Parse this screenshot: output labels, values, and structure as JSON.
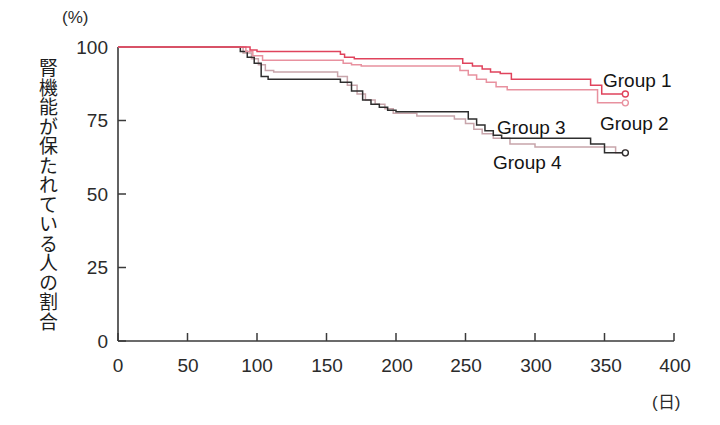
{
  "chart_data": {
    "type": "line",
    "title": "",
    "subtitle": "",
    "xlabel": "(日)",
    "ylabel": "腎機能が保たれている人の割合",
    "y_unit": "(%)",
    "x_unit": "(日)",
    "xlim": [
      0,
      400
    ],
    "ylim": [
      0,
      100
    ],
    "xticks": [
      0,
      50,
      100,
      150,
      200,
      250,
      300,
      350,
      400
    ],
    "xtick_labels": [
      "0",
      "50",
      "100",
      "150",
      "200",
      "250",
      "300",
      "350",
      "400"
    ],
    "yticks": [
      0,
      25,
      50,
      75,
      100
    ],
    "ytick_labels": [
      "0",
      "25",
      "50",
      "75",
      "100"
    ],
    "grid": false,
    "legend_position": "inline-right",
    "step_type": "post",
    "marker": "open-circle-endpoint",
    "series": [
      {
        "name": "Group 1",
        "color": "#e0435c",
        "label_x": 400,
        "label_y": 89,
        "end_value": 84,
        "x": [
          0,
          82,
          95,
          100,
          155,
          160,
          163,
          170,
          240,
          248,
          255,
          262,
          268,
          275,
          283,
          330,
          340,
          348,
          365
        ],
        "y": [
          100,
          100,
          99,
          98.5,
          98.5,
          97.5,
          96.5,
          96,
          96,
          94.5,
          93.5,
          92.5,
          91.5,
          91,
          89,
          89,
          87,
          84,
          84
        ]
      },
      {
        "name": "Group 2",
        "color": "#e8919f",
        "label_x": 400,
        "label_y": 77,
        "end_value": 81,
        "x": [
          0,
          85,
          92,
          97,
          104,
          158,
          162,
          168,
          175,
          238,
          246,
          252,
          258,
          265,
          272,
          280,
          300,
          335,
          345,
          365
        ],
        "y": [
          100,
          100,
          98.5,
          97,
          95.5,
          95.5,
          94.5,
          94,
          93.5,
          93.5,
          92,
          90.5,
          89,
          88,
          86.5,
          85.5,
          85.5,
          85.5,
          81,
          81
        ]
      },
      {
        "name": "Group 3",
        "color": "#2e2e2e",
        "label_x": 268,
        "label_y": 78,
        "end_value": 64,
        "x": [
          0,
          80,
          88,
          93,
          98,
          103,
          108,
          150,
          160,
          168,
          176,
          182,
          188,
          194,
          200,
          210,
          246,
          252,
          258,
          264,
          270,
          276,
          300,
          330,
          340,
          350,
          365
        ],
        "y": [
          100,
          100,
          98.5,
          96.5,
          94.5,
          90,
          89,
          89,
          88,
          85,
          82,
          80.5,
          79.5,
          78.5,
          78,
          78,
          78,
          75.5,
          73.5,
          71.5,
          70,
          69,
          69,
          69,
          67,
          64,
          64
        ]
      },
      {
        "name": "Group 4",
        "color": "#c8a5ab",
        "label_x": 258,
        "label_y": 64,
        "end_value": 64,
        "x": [
          0,
          83,
          90,
          96,
          101,
          106,
          112,
          152,
          158,
          165,
          172,
          178,
          185,
          192,
          198,
          215,
          235,
          242,
          250,
          256,
          262,
          270,
          282,
          300,
          320,
          345,
          358,
          365
        ],
        "y": [
          100,
          100,
          98,
          96,
          94,
          92,
          91.5,
          91.5,
          90,
          87,
          84,
          82,
          80.5,
          79,
          77.5,
          76.5,
          76.5,
          75.5,
          74,
          72,
          70.5,
          69,
          67,
          66,
          66,
          66,
          64,
          64
        ]
      }
    ]
  },
  "axes": {
    "y_unit_label": "(%)",
    "x_unit_label": "(日)",
    "y_title": "腎機能が保たれている人の割合"
  },
  "labels": {
    "group1": "Group 1",
    "group2": "Group 2",
    "group3": "Group 3",
    "group4": "Group 4",
    "y0": "0",
    "y25": "25",
    "y50": "50",
    "y75": "75",
    "y100": "100",
    "x0": "0",
    "x50": "50",
    "x100": "100",
    "x150": "150",
    "x200": "200",
    "x250": "250",
    "x300": "300",
    "x350": "350",
    "x400": "400"
  }
}
